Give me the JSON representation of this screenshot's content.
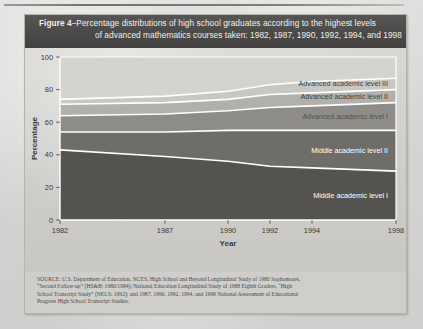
{
  "figure": {
    "title_prefix": "Figure 4",
    "title_line1": "–Percentage distributions of high school graduates according to the highest levels",
    "title_line2": "of advanced mathematics courses taken: 1982, 1987, 1990, 1992, 1994, and 1998"
  },
  "source": {
    "line1": "SOURCE: U.S. Department of Education, NCES, High School and Beyond Longitudinal Study of 1980 Sophomores,",
    "line2": "“Second Follow-up” (HS&B: 1980/1984); National Education Longitudinal Study of 1988 Eighth Graders, “High",
    "line3": "School Transcript Study” (NELS: 1992); and 1987, 1990, 1992, 1994, and 1998 National Assessment of Educational",
    "line4": "Progress High School Transcript Studies."
  },
  "chart_data": {
    "type": "area",
    "title": "Percentage distributions of high school graduates according to the highest levels of advanced mathematics courses taken: 1982, 1987, 1990, 1992, 1994, and 1998",
    "xlabel": "Year",
    "ylabel": "Percentage",
    "x": [
      1982,
      1987,
      1990,
      1992,
      1994,
      1998
    ],
    "xticklabels": [
      "1982",
      "1987",
      "1990",
      "1992",
      "1994",
      "1998"
    ],
    "yticks": [
      0,
      20,
      40,
      60,
      80,
      100
    ],
    "yticklabels": [
      "0",
      "20",
      "40",
      "60",
      "80",
      "100"
    ],
    "ylim": [
      0,
      100
    ],
    "grid": false,
    "stacked": true,
    "legend": "inline-band-labels",
    "series": [
      {
        "name": "Middle academic level I",
        "values": [
          43,
          39,
          36,
          33,
          32,
          30
        ],
        "cumulative": [
          43,
          39,
          36,
          33,
          32,
          30
        ],
        "color": "#55534f",
        "label_color": "#ffffff"
      },
      {
        "name": "Middle academic level II",
        "values": [
          11,
          15,
          19,
          22,
          23,
          25
        ],
        "cumulative": [
          54,
          54,
          55,
          55,
          55,
          55
        ],
        "color": "#6f6d69",
        "label_color": "#ffffff"
      },
      {
        "name": "Advanced academic level I",
        "values": [
          10,
          11,
          12,
          14,
          15,
          17
        ],
        "cumulative": [
          64,
          65,
          67,
          69,
          70,
          72
        ],
        "color": "#8e8c88",
        "label_color": "#55534f"
      },
      {
        "name": "Advanced academic level II",
        "values": [
          7,
          7,
          7,
          8,
          8,
          8
        ],
        "cumulative": [
          71,
          72,
          74,
          77,
          78,
          80
        ],
        "color": "#b2b0ac",
        "label_color": "#3c3b39"
      },
      {
        "name": "Advanced academic level III",
        "values": [
          3,
          4,
          5,
          6,
          7,
          7
        ],
        "cumulative": [
          74,
          76,
          79,
          83,
          85,
          87
        ],
        "color": "#c9c7c3",
        "label_color": "#3c3b39"
      }
    ],
    "band_labels": [
      "Advanced academic level III",
      "Advanced academic level II",
      "Advanced academic level I",
      "Middle academic level II",
      "Middle academic level I"
    ]
  },
  "colors": {
    "title_band": "#4c4b49",
    "panel": "#d2d1ce",
    "paper": "#d6d5d3",
    "separator": "#ffffff"
  }
}
